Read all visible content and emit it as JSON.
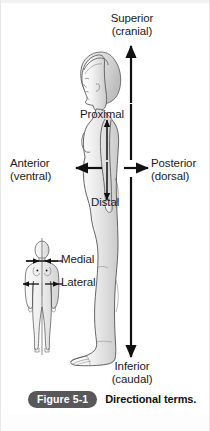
{
  "figure": {
    "badge": "Figure 5-1",
    "caption": "Directional terms.",
    "title": "Directional terms",
    "badge_color": "#58585a",
    "caption_color": "#111111",
    "background_color": "#ffffff",
    "ink_color": "#1b1b1b"
  },
  "labels": {
    "superior": {
      "primary": "Superior",
      "secondary": "(cranial)"
    },
    "inferior": {
      "primary": "Inferior",
      "secondary": "(caudal)"
    },
    "anterior": {
      "primary": "Anterior",
      "secondary": "(ventral)"
    },
    "posterior": {
      "primary": "Posterior",
      "secondary": "(dorsal)"
    },
    "proximal": {
      "primary": "Proximal"
    },
    "distal": {
      "primary": "Distal"
    },
    "medial": {
      "primary": "Medial"
    },
    "lateral": {
      "primary": "Lateral"
    }
  },
  "figures": {
    "lateral_view": {
      "name": "female-lateral-view",
      "description": "Female body shown in left-facing lateral profile, full length, standing"
    },
    "anterior_view": {
      "name": "female-anterior-view",
      "description": "Small female body shown in anterior (frontal) view with vertical midline"
    }
  },
  "arrows": [
    {
      "name": "superior-arrow",
      "direction": "up",
      "label": "Superior (cranial)"
    },
    {
      "name": "inferior-arrow",
      "direction": "down",
      "label": "Inferior (caudal)"
    },
    {
      "name": "anterior-arrow",
      "direction": "left",
      "label": "Anterior (ventral)"
    },
    {
      "name": "posterior-arrow",
      "direction": "right",
      "label": "Posterior (dorsal)"
    },
    {
      "name": "proximal-arrow",
      "direction": "up",
      "label": "Proximal"
    },
    {
      "name": "distal-arrow",
      "direction": "down",
      "label": "Distal"
    },
    {
      "name": "medial-arrow-left",
      "direction": "right",
      "label": "Medial"
    },
    {
      "name": "medial-arrow-right",
      "direction": "left",
      "label": "Medial"
    },
    {
      "name": "lateral-arrow-left",
      "direction": "left",
      "label": "Lateral"
    },
    {
      "name": "lateral-arrow-right",
      "direction": "right",
      "label": "Lateral"
    }
  ]
}
